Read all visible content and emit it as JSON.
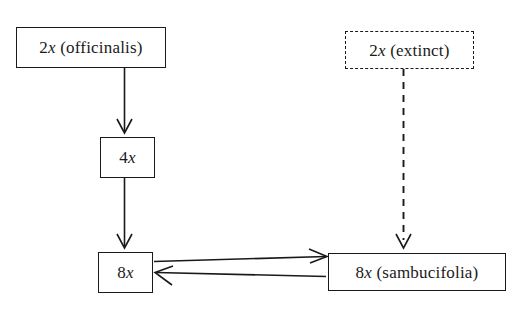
{
  "diagram": {
    "background_color": "#ffffff",
    "line_color": "#1a1a1a",
    "nodes": [
      {
        "id": "officinalis",
        "ploidy": "2",
        "variable": "x",
        "annotation": " (officinalis)",
        "border_style": "solid"
      },
      {
        "id": "extinct",
        "ploidy": "2",
        "variable": "x",
        "annotation": " (extinct)",
        "border_style": "dashed"
      },
      {
        "id": "tetraploid",
        "ploidy": "4",
        "variable": "x",
        "annotation": "",
        "border_style": "solid"
      },
      {
        "id": "octoploid",
        "ploidy": "8",
        "variable": "x",
        "annotation": "",
        "border_style": "solid"
      },
      {
        "id": "sambucifolia",
        "ploidy": "8",
        "variable": "x",
        "annotation": " (sambucifolia)",
        "border_style": "solid"
      }
    ],
    "edges": [
      {
        "id": "officinalis-to-4x",
        "from": "officinalis",
        "to": "tetraploid",
        "style": "solid",
        "direction": "down"
      },
      {
        "id": "4x-to-8x",
        "from": "tetraploid",
        "to": "octoploid",
        "style": "solid",
        "direction": "down"
      },
      {
        "id": "8x-to-sambucifolia",
        "from": "octoploid",
        "to": "sambucifolia",
        "style": "solid",
        "direction": "right"
      },
      {
        "id": "sambucifolia-to-8x",
        "from": "sambucifolia",
        "to": "octoploid",
        "style": "solid",
        "direction": "left"
      },
      {
        "id": "extinct-to-sambucifolia",
        "from": "extinct",
        "to": "sambucifolia",
        "style": "dashed",
        "direction": "down"
      }
    ]
  }
}
